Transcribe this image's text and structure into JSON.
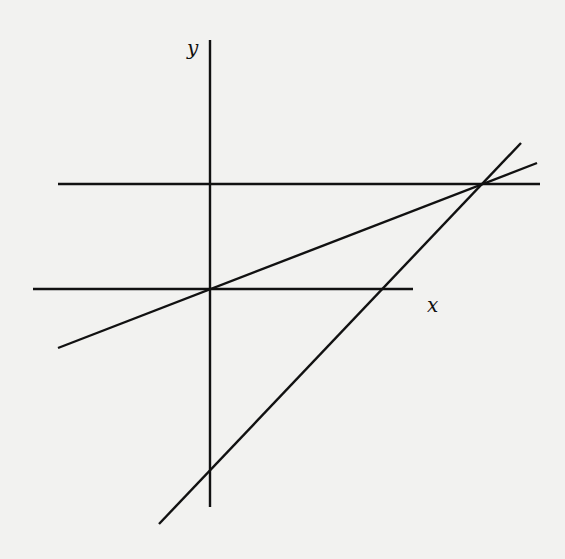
{
  "diagram": {
    "type": "coordinate-lines",
    "axes": {
      "x_label": "x",
      "y_label": "y"
    },
    "lines": [
      {
        "name": "y-axis",
        "x1": 210,
        "y1": 40,
        "x2": 210,
        "y2": 507
      },
      {
        "name": "x-axis",
        "x1": 33,
        "y1": 289,
        "x2": 413,
        "y2": 289
      },
      {
        "name": "horizontal-line",
        "x1": 58,
        "y1": 184,
        "x2": 540,
        "y2": 184
      },
      {
        "name": "line-through-origin",
        "x1": 58,
        "y1": 348,
        "x2": 537,
        "y2": 163
      },
      {
        "name": "steep-line",
        "x1": 159,
        "y1": 524,
        "x2": 521,
        "y2": 143
      }
    ],
    "colors": {
      "background": "#f2f2f0",
      "stroke": "#111111"
    }
  }
}
